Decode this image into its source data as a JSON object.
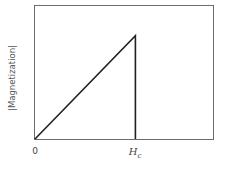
{
  "chart_data": {
    "type": "line",
    "title": "",
    "xlabel": "",
    "ylabel": "|Magnetization|",
    "x_ticks": [
      "0",
      "H_c"
    ],
    "series": [
      {
        "name": "magnetization",
        "points": [
          {
            "x": 0,
            "y": 0
          },
          {
            "x": 0.564,
            "y": 0.77
          },
          {
            "x": 0.564,
            "y": 0
          }
        ]
      }
    ],
    "xlim": [
      0,
      1
    ],
    "ylim": [
      0,
      1
    ],
    "grid": false,
    "legend": null,
    "annotations": [
      "Linear rise from 0 to H_c, then abrupt drop to zero at H_c"
    ]
  },
  "labels": {
    "ylabel": "|Magnetization|",
    "tick_zero": "0",
    "tick_hc_main": "H",
    "tick_hc_sub": "c"
  },
  "colors": {
    "frame": "#6b6b6b",
    "curve": "#222222"
  }
}
